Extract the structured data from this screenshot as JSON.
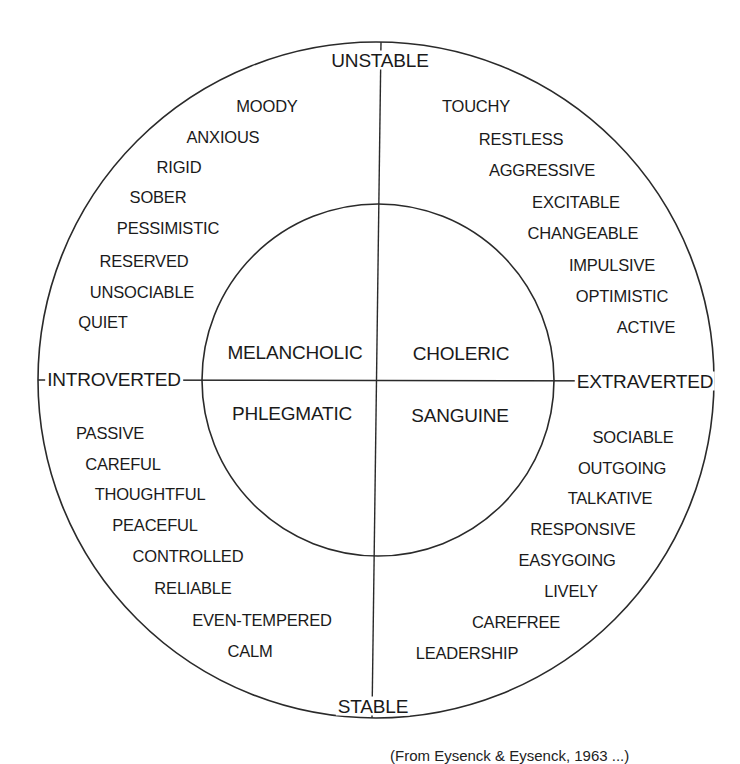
{
  "diagram": {
    "type": "circumplex",
    "axes": {
      "top": "UNSTABLE",
      "bottom": "STABLE",
      "left": "INTROVERTED",
      "right": "EXTRAVERTED"
    },
    "temperaments": {
      "top_left": "MELANCHOLIC",
      "top_right": "CHOLERIC",
      "bottom_left": "PHLEGMATIC",
      "bottom_right": "SANGUINE"
    },
    "traits": {
      "unstable_introverted": [
        "MOODY",
        "ANXIOUS",
        "RIGID",
        "SOBER",
        "PESSIMISTIC",
        "RESERVED",
        "UNSOCIABLE",
        "QUIET"
      ],
      "unstable_extraverted": [
        "TOUCHY",
        "RESTLESS",
        "AGGRESSIVE",
        "EXCITABLE",
        "CHANGEABLE",
        "IMPULSIVE",
        "OPTIMISTIC",
        "ACTIVE"
      ],
      "stable_introverted": [
        "PASSIVE",
        "CAREFUL",
        "THOUGHTFUL",
        "PEACEFUL",
        "CONTROLLED",
        "RELIABLE",
        "EVEN-TEMPERED",
        "CALM"
      ],
      "stable_extraverted": [
        "SOCIABLE",
        "OUTGOING",
        "TALKATIVE",
        "RESPONSIVE",
        "EASYGOING",
        "LIVELY",
        "CAREFREE",
        "LEADERSHIP"
      ]
    },
    "caption": "(From Eysenck & Eysenck, 1963 ...)",
    "colors": {
      "line": "#2a2a2a",
      "text": "#1a1a1a",
      "background": "#ffffff"
    }
  }
}
